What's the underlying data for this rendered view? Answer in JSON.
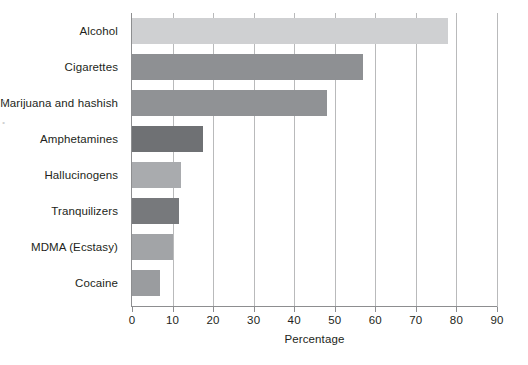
{
  "chart_data": {
    "type": "bar",
    "orientation": "horizontal",
    "title": "",
    "xlabel": "Percentage",
    "ylabel": "",
    "xlim": [
      0,
      90
    ],
    "xticks": [
      0,
      10,
      20,
      30,
      40,
      50,
      60,
      70,
      80,
      90
    ],
    "xtick_labels": [
      "0",
      "10",
      "20",
      "30",
      "40",
      "50",
      "60",
      "70",
      "80",
      "90"
    ],
    "grid": "vertical",
    "legend": "none",
    "categories": [
      "Alcohol",
      "Cigarettes",
      "Marijuana and hashish",
      "Amphetamines",
      "Hallucinogens",
      "Tranquilizers",
      "MDMA (Ecstasy)",
      "Cocaine"
    ],
    "values": [
      78,
      57,
      48,
      17.5,
      12,
      11.5,
      10,
      7
    ],
    "bar_colors": [
      "#cfd0d2",
      "#8e9093",
      "#909295",
      "#6f7174",
      "#a9abae",
      "#77797c",
      "#a2a4a7",
      "#9a9c9f"
    ]
  },
  "axis": {
    "line_color": "#8d8e90",
    "grid_color": "#b9babb",
    "text_color": "#231f20"
  },
  "artifacts": {
    "left_edge_marks": [
      "•",
      "•"
    ]
  }
}
